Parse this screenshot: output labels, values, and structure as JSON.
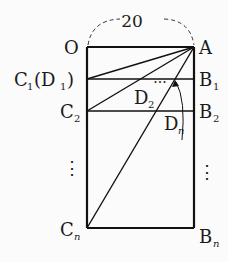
{
  "diagram": {
    "dimension_label": "20",
    "points": {
      "O": {
        "label": "O"
      },
      "A": {
        "label": "A"
      },
      "C1": {
        "label": "C",
        "sub": "1",
        "suffix_open": "(D",
        "suffix_sub": "1",
        "suffix_close": ")"
      },
      "C2": {
        "label": "C",
        "sub": "2"
      },
      "Cn": {
        "label": "C",
        "sub": "n"
      },
      "B1": {
        "label": "B",
        "sub": "1"
      },
      "B2": {
        "label": "B",
        "sub": "2"
      },
      "Bn": {
        "label": "B",
        "sub": "n"
      },
      "D2": {
        "label": "D",
        "sub": "2"
      },
      "Dn": {
        "label": "D",
        "sub": "n"
      }
    },
    "ellipsis_left": "⋮",
    "ellipsis_right": "⋮",
    "ellipsis_dots": "···",
    "colors": {
      "line": "#111111",
      "background": "#fbfbfb"
    }
  }
}
